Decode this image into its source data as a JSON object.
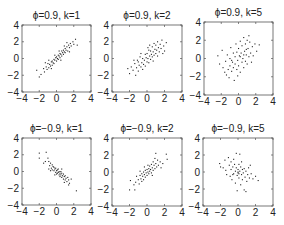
{
  "chart_data": [
    {
      "type": "scatter",
      "title": "ϕ=0.9, k=1",
      "xlabel": "",
      "ylabel": "",
      "xlim": [
        -4,
        4
      ],
      "ylim": [
        -4,
        4
      ],
      "xticks": [
        "-4",
        "-2",
        "0",
        "2",
        "4"
      ],
      "yticks": [
        "-4",
        "-2",
        "0",
        "2",
        "4"
      ],
      "grid": false,
      "points": [
        [
          -2.0,
          -2.2
        ],
        [
          -1.8,
          -1.9
        ],
        [
          -1.5,
          -1.2
        ],
        [
          -1.4,
          -1.6
        ],
        [
          -1.2,
          -1.0
        ],
        [
          -1.1,
          -1.3
        ],
        [
          -1.0,
          -0.6
        ],
        [
          -0.9,
          -1.1
        ],
        [
          -0.8,
          -0.7
        ],
        [
          -0.7,
          -0.9
        ],
        [
          -0.6,
          -0.4
        ],
        [
          -0.5,
          -0.8
        ],
        [
          -0.5,
          -0.3
        ],
        [
          -0.4,
          -0.5
        ],
        [
          -0.3,
          -0.1
        ],
        [
          -0.3,
          -0.6
        ],
        [
          -0.2,
          -0.2
        ],
        [
          -0.1,
          0.1
        ],
        [
          0.0,
          -0.3
        ],
        [
          0.0,
          0.2
        ],
        [
          0.1,
          0.0
        ],
        [
          0.2,
          0.4
        ],
        [
          0.2,
          -0.1
        ],
        [
          0.3,
          0.3
        ],
        [
          0.4,
          0.6
        ],
        [
          0.4,
          0.1
        ],
        [
          0.5,
          0.5
        ],
        [
          0.6,
          0.9
        ],
        [
          0.6,
          0.3
        ],
        [
          0.7,
          0.7
        ],
        [
          0.8,
          1.0
        ],
        [
          0.8,
          0.5
        ],
        [
          0.9,
          0.8
        ],
        [
          1.0,
          1.2
        ],
        [
          1.0,
          0.7
        ],
        [
          1.1,
          1.0
        ],
        [
          1.2,
          1.4
        ],
        [
          1.3,
          0.9
        ],
        [
          1.4,
          1.6
        ],
        [
          1.5,
          1.3
        ],
        [
          1.6,
          1.8
        ],
        [
          1.7,
          1.5
        ],
        [
          1.9,
          2.0
        ],
        [
          2.0,
          1.7
        ],
        [
          2.2,
          2.3
        ],
        [
          2.4,
          1.6
        ],
        [
          -0.6,
          -1.2
        ],
        [
          0.3,
          0.9
        ],
        [
          -1.3,
          -0.5
        ],
        [
          1.2,
          1.9
        ],
        [
          0.9,
          1.5
        ],
        [
          -0.2,
          0.4
        ],
        [
          0.5,
          -0.2
        ],
        [
          -0.9,
          -0.2
        ],
        [
          1.5,
          0.8
        ],
        [
          -2.3,
          -1.4
        ]
      ]
    },
    {
      "type": "scatter",
      "title": "ϕ=0.9, k=2",
      "xlabel": "",
      "ylabel": "",
      "xlim": [
        -4,
        4
      ],
      "ylim": [
        -4,
        4
      ],
      "xticks": [
        "-4",
        "-2",
        "0",
        "2",
        "4"
      ],
      "yticks": [
        "-4",
        "-2",
        "0",
        "2",
        "4"
      ],
      "grid": false,
      "points": [
        [
          -2.0,
          -1.8
        ],
        [
          -1.8,
          -1.0
        ],
        [
          -1.6,
          -1.4
        ],
        [
          -1.4,
          -0.6
        ],
        [
          -1.3,
          -2.0
        ],
        [
          -1.2,
          -1.1
        ],
        [
          -1.0,
          -0.4
        ],
        [
          -1.0,
          -1.5
        ],
        [
          -0.9,
          -0.8
        ],
        [
          -0.8,
          0.2
        ],
        [
          -0.7,
          -1.0
        ],
        [
          -0.6,
          -0.5
        ],
        [
          -0.5,
          -1.3
        ],
        [
          -0.5,
          0.0
        ],
        [
          -0.4,
          -0.7
        ],
        [
          -0.3,
          -0.2
        ],
        [
          -0.2,
          0.5
        ],
        [
          -0.2,
          -0.9
        ],
        [
          -0.1,
          0.1
        ],
        [
          0.0,
          -0.4
        ],
        [
          0.0,
          0.6
        ],
        [
          0.1,
          0.0
        ],
        [
          0.2,
          1.0
        ],
        [
          0.2,
          -0.5
        ],
        [
          0.3,
          0.3
        ],
        [
          0.4,
          0.9
        ],
        [
          0.4,
          -0.1
        ],
        [
          0.5,
          0.5
        ],
        [
          0.6,
          1.4
        ],
        [
          0.6,
          0.2
        ],
        [
          0.7,
          0.8
        ],
        [
          0.8,
          1.8
        ],
        [
          0.8,
          0.4
        ],
        [
          0.9,
          1.1
        ],
        [
          1.0,
          0.6
        ],
        [
          1.0,
          1.6
        ],
        [
          1.1,
          1.0
        ],
        [
          1.2,
          2.0
        ],
        [
          1.3,
          1.3
        ],
        [
          1.4,
          0.8
        ],
        [
          1.5,
          1.7
        ],
        [
          1.6,
          1.2
        ],
        [
          1.7,
          2.2
        ],
        [
          1.9,
          1.5
        ],
        [
          2.0,
          0.9
        ],
        [
          2.2,
          1.9
        ],
        [
          -1.5,
          -0.2
        ],
        [
          0.3,
          1.6
        ],
        [
          -0.7,
          0.6
        ],
        [
          1.2,
          0.3
        ],
        [
          -2.2,
          -1.2
        ],
        [
          0.7,
          -0.3
        ],
        [
          1.8,
          0.6
        ],
        [
          -1.1,
          -0.2
        ],
        [
          0.1,
          1.3
        ]
      ]
    },
    {
      "type": "scatter",
      "title": "ϕ=0.9, k=5",
      "xlabel": "",
      "ylabel": "",
      "xlim": [
        -4,
        4
      ],
      "ylim": [
        -4,
        4
      ],
      "xticks": [
        "-4",
        "-2",
        "0",
        "2",
        "4"
      ],
      "yticks": [
        "-4",
        "-2",
        "0",
        "2",
        "4"
      ],
      "grid": false,
      "points": [
        [
          -2.4,
          0.3
        ],
        [
          -2.2,
          -0.6
        ],
        [
          -1.9,
          0.9
        ],
        [
          -1.8,
          -1.0
        ],
        [
          -1.5,
          -0.3
        ],
        [
          -1.4,
          -1.8
        ],
        [
          -1.3,
          0.4
        ],
        [
          -1.2,
          -1.2
        ],
        [
          -1.1,
          -2.1
        ],
        [
          -1.0,
          0.0
        ],
        [
          -1.0,
          -0.8
        ],
        [
          -0.9,
          1.2
        ],
        [
          -0.8,
          -1.4
        ],
        [
          -0.7,
          -0.4
        ],
        [
          -0.6,
          0.6
        ],
        [
          -0.6,
          -1.0
        ],
        [
          -0.5,
          -2.4
        ],
        [
          -0.4,
          0.2
        ],
        [
          -0.4,
          -0.6
        ],
        [
          -0.3,
          1.6
        ],
        [
          -0.2,
          -1.2
        ],
        [
          -0.2,
          0.7
        ],
        [
          -0.1,
          -0.2
        ],
        [
          0.0,
          1.1
        ],
        [
          0.0,
          -0.8
        ],
        [
          0.1,
          0.3
        ],
        [
          0.2,
          1.9
        ],
        [
          0.2,
          -1.5
        ],
        [
          0.3,
          0.6
        ],
        [
          0.4,
          -0.4
        ],
        [
          0.4,
          1.4
        ],
        [
          0.5,
          0.0
        ],
        [
          0.6,
          2.3
        ],
        [
          0.6,
          -1.0
        ],
        [
          0.7,
          0.8
        ],
        [
          0.8,
          1.6
        ],
        [
          0.8,
          -0.3
        ],
        [
          0.9,
          0.4
        ],
        [
          1.0,
          2.0
        ],
        [
          1.0,
          -0.6
        ],
        [
          1.1,
          1.1
        ],
        [
          1.2,
          0.2
        ],
        [
          1.3,
          1.8
        ],
        [
          1.4,
          0.6
        ],
        [
          1.5,
          -0.4
        ],
        [
          1.6,
          1.3
        ],
        [
          1.7,
          0.3
        ],
        [
          1.9,
          1.6
        ],
        [
          2.1,
          0.8
        ],
        [
          2.4,
          1.5
        ],
        [
          -1.6,
          -1.5
        ],
        [
          0.2,
          0.2
        ],
        [
          0.6,
          0.4
        ],
        [
          -0.8,
          -0.2
        ],
        [
          1.2,
          2.5
        ],
        [
          -0.1,
          -1.9
        ],
        [
          0.9,
          1.0
        ]
      ]
    },
    {
      "type": "scatter",
      "title": "ϕ=−0.9, k=1",
      "xlabel": "",
      "ylabel": "",
      "xlim": [
        -4,
        4
      ],
      "ylim": [
        -4,
        4
      ],
      "xticks": [
        "-4",
        "-2",
        "0",
        "2",
        "4"
      ],
      "yticks": [
        "-4",
        "-2",
        "0",
        "2",
        "4"
      ],
      "grid": false,
      "points": [
        [
          -2.0,
          2.2
        ],
        [
          -2.0,
          1.6
        ],
        [
          -1.2,
          2.3
        ],
        [
          -1.0,
          1.6
        ],
        [
          -0.9,
          1.2
        ],
        [
          -0.8,
          0.7
        ],
        [
          -0.7,
          1.0
        ],
        [
          -0.6,
          0.4
        ],
        [
          -0.5,
          0.8
        ],
        [
          -0.5,
          0.2
        ],
        [
          -0.4,
          0.6
        ],
        [
          -0.3,
          0.1
        ],
        [
          -0.3,
          0.5
        ],
        [
          -0.2,
          0.3
        ],
        [
          -0.1,
          -0.1
        ],
        [
          -0.1,
          0.4
        ],
        [
          0.0,
          0.1
        ],
        [
          0.0,
          -0.3
        ],
        [
          0.1,
          0.2
        ],
        [
          0.1,
          -0.2
        ],
        [
          0.2,
          -0.1
        ],
        [
          0.2,
          0.3
        ],
        [
          0.3,
          -0.4
        ],
        [
          0.3,
          0.0
        ],
        [
          0.4,
          -0.2
        ],
        [
          0.4,
          -0.6
        ],
        [
          0.5,
          0.0
        ],
        [
          0.5,
          -0.4
        ],
        [
          0.6,
          -0.7
        ],
        [
          0.6,
          -0.2
        ],
        [
          0.7,
          -0.5
        ],
        [
          0.8,
          -0.9
        ],
        [
          0.8,
          -0.3
        ],
        [
          0.9,
          -0.6
        ],
        [
          1.0,
          -1.0
        ],
        [
          1.0,
          -0.5
        ],
        [
          1.1,
          -0.8
        ],
        [
          1.2,
          -1.2
        ],
        [
          1.3,
          -0.7
        ],
        [
          1.4,
          -1.0
        ],
        [
          1.5,
          -1.4
        ],
        [
          2.3,
          -2.3
        ],
        [
          -1.5,
          1.0
        ],
        [
          -1.3,
          1.2
        ],
        [
          -0.9,
          0.3
        ],
        [
          -0.2,
          -0.4
        ],
        [
          0.6,
          0.3
        ],
        [
          0.9,
          -1.3
        ],
        [
          1.7,
          -0.9
        ],
        [
          -0.7,
          0.1
        ],
        [
          1.4,
          -1.6
        ]
      ]
    },
    {
      "type": "scatter",
      "title": "ϕ=−0.9, k=2",
      "xlabel": "",
      "ylabel": "",
      "xlim": [
        -4,
        4
      ],
      "ylim": [
        -4,
        4
      ],
      "xticks": [
        "-4",
        "-2",
        "0",
        "2",
        "4"
      ],
      "yticks": [
        "-4",
        "-2",
        "0",
        "2",
        "4"
      ],
      "grid": false,
      "points": [
        [
          -2.0,
          -2.1
        ],
        [
          -1.9,
          -1.0
        ],
        [
          -1.4,
          -2.1
        ],
        [
          -1.3,
          -1.2
        ],
        [
          -1.2,
          -0.5
        ],
        [
          -1.0,
          -0.9
        ],
        [
          -0.9,
          -1.4
        ],
        [
          -0.8,
          -0.4
        ],
        [
          -0.7,
          -0.8
        ],
        [
          -0.6,
          -1.1
        ],
        [
          -0.6,
          -0.2
        ],
        [
          -0.5,
          -0.5
        ],
        [
          -0.4,
          -0.9
        ],
        [
          -0.4,
          0.0
        ],
        [
          -0.3,
          -0.3
        ],
        [
          -0.2,
          -0.6
        ],
        [
          -0.2,
          0.2
        ],
        [
          -0.1,
          -0.1
        ],
        [
          0.0,
          -0.4
        ],
        [
          0.0,
          0.3
        ],
        [
          0.1,
          0.0
        ],
        [
          0.2,
          0.4
        ],
        [
          0.2,
          -0.2
        ],
        [
          0.3,
          0.7
        ],
        [
          0.3,
          0.1
        ],
        [
          0.4,
          0.3
        ],
        [
          0.5,
          0.9
        ],
        [
          0.5,
          -0.1
        ],
        [
          0.6,
          0.5
        ],
        [
          0.7,
          1.2
        ],
        [
          0.7,
          0.2
        ],
        [
          0.8,
          0.8
        ],
        [
          0.9,
          0.4
        ],
        [
          1.0,
          1.0
        ],
        [
          1.1,
          0.6
        ],
        [
          1.2,
          1.4
        ],
        [
          1.3,
          0.8
        ],
        [
          1.5,
          1.2
        ],
        [
          1.6,
          0.5
        ],
        [
          2.2,
          2.1
        ],
        [
          1.0,
          2.2
        ],
        [
          0.1,
          0.8
        ],
        [
          -0.8,
          0.1
        ],
        [
          0.6,
          -0.4
        ],
        [
          -1.5,
          -1.5
        ],
        [
          0.9,
          1.6
        ],
        [
          1.8,
          1.0
        ],
        [
          -0.3,
          0.6
        ],
        [
          2.3,
          1.5
        ]
      ]
    },
    {
      "type": "scatter",
      "title": "ϕ=−0.9, k=5",
      "xlabel": "",
      "ylabel": "",
      "xlim": [
        -4,
        4
      ],
      "ylim": [
        -4,
        4
      ],
      "xticks": [
        "-4",
        "-2",
        "0",
        "2",
        "4"
      ],
      "yticks": [
        "-4",
        "-2",
        "0",
        "2",
        "4"
      ],
      "grid": false,
      "points": [
        [
          -2.1,
          1.0
        ],
        [
          -2.0,
          0.6
        ],
        [
          -1.5,
          1.4
        ],
        [
          -1.4,
          0.2
        ],
        [
          -1.3,
          -0.3
        ],
        [
          -1.1,
          1.7
        ],
        [
          -1.0,
          0.8
        ],
        [
          -0.9,
          -0.5
        ],
        [
          -0.8,
          1.2
        ],
        [
          -0.8,
          0.3
        ],
        [
          -0.7,
          -0.9
        ],
        [
          -0.6,
          0.6
        ],
        [
          -0.5,
          1.5
        ],
        [
          -0.5,
          -0.2
        ],
        [
          -0.4,
          0.9
        ],
        [
          -0.3,
          0.1
        ],
        [
          -0.3,
          -1.3
        ],
        [
          -0.2,
          0.5
        ],
        [
          -0.2,
          2.2
        ],
        [
          -0.1,
          -0.4
        ],
        [
          0.0,
          0.3
        ],
        [
          0.0,
          -0.1
        ],
        [
          0.1,
          0.9
        ],
        [
          0.1,
          -0.7
        ],
        [
          0.2,
          0.1
        ],
        [
          0.3,
          -1.5
        ],
        [
          0.3,
          0.6
        ],
        [
          0.4,
          -0.3
        ],
        [
          0.5,
          0.3
        ],
        [
          0.5,
          -0.9
        ],
        [
          0.6,
          -0.1
        ],
        [
          0.7,
          -2.1
        ],
        [
          0.7,
          0.4
        ],
        [
          0.8,
          -0.6
        ],
        [
          0.9,
          0.1
        ],
        [
          1.0,
          -1.1
        ],
        [
          1.1,
          -0.3
        ],
        [
          1.2,
          0.5
        ],
        [
          1.3,
          -0.7
        ],
        [
          1.5,
          -0.2
        ],
        [
          1.7,
          -0.8
        ],
        [
          2.0,
          -0.5
        ],
        [
          2.3,
          -1.0
        ],
        [
          -0.1,
          -2.2
        ],
        [
          0.9,
          -2.3
        ],
        [
          0.2,
          2.1
        ],
        [
          -1.7,
          0.5
        ],
        [
          0.4,
          1.2
        ],
        [
          -0.6,
          -0.3
        ],
        [
          1.4,
          0.8
        ],
        [
          0.0,
          0.0
        ],
        [
          0.1,
          -0.2
        ]
      ]
    }
  ]
}
